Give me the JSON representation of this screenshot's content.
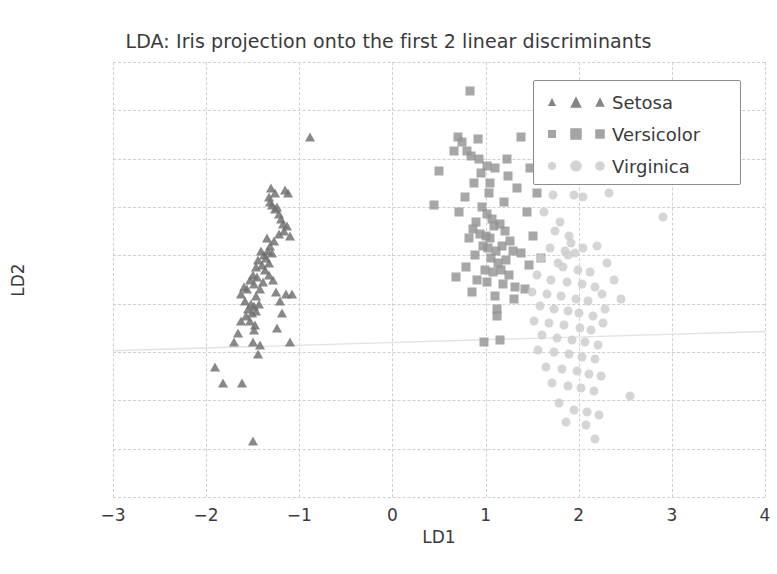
{
  "chart_data": {
    "type": "scatter",
    "title": "LDA: Iris projection onto the first 2 linear discriminants",
    "xlabel": "LD1",
    "ylabel": "LD2",
    "xlim": [
      -3,
      4
    ],
    "ylim": [
      -2.8,
      -1.0
    ],
    "xticks": [
      "-3",
      "-2",
      "-1",
      "0",
      "1",
      "2",
      "3",
      "4"
    ],
    "xtick_values": [
      -3,
      -2,
      -1,
      0,
      1,
      2,
      3,
      4
    ],
    "yticks": [
      "-1.0",
      "-1.2",
      "-1.4",
      "-1.6",
      "-1.8",
      "-2.0",
      "-2.2",
      "-2.4",
      "-2.6",
      "-2.8"
    ],
    "ytick_values": [
      -1.0,
      -1.2,
      -1.4,
      -1.6,
      -1.8,
      -2.0,
      -2.2,
      -2.4,
      -2.6,
      -2.8
    ],
    "grid": true,
    "legend_position": "upper right",
    "colors": {
      "setosa": "#6e6e6e",
      "versicolor": "#949494",
      "virginica": "#cccccc",
      "grid": "#cfcfcf",
      "text": "#3a3a3a",
      "legend_border": "#8d8d8d",
      "trendline": "#e2e2e2"
    },
    "trendline": {
      "x": [
        -3.0,
        4.0
      ],
      "y": [
        -2.195,
        -2.115
      ]
    },
    "series": [
      {
        "name": "Setosa",
        "marker": "triangle",
        "color": "#6e6e6e",
        "points": [
          [
            -1.3,
            -1.52
          ],
          [
            -1.26,
            -1.54
          ],
          [
            -1.33,
            -1.56
          ],
          [
            -1.15,
            -1.53
          ],
          [
            -1.12,
            -1.54
          ],
          [
            -1.29,
            -1.59
          ],
          [
            -1.26,
            -1.61
          ],
          [
            -1.22,
            -1.63
          ],
          [
            -1.31,
            -1.58
          ],
          [
            -1.24,
            -1.6
          ],
          [
            -1.2,
            -1.65
          ],
          [
            -1.18,
            -1.67
          ],
          [
            -1.16,
            -1.7
          ],
          [
            -1.13,
            -1.68
          ],
          [
            -1.1,
            -1.72
          ],
          [
            -1.22,
            -1.71
          ],
          [
            -1.27,
            -1.74
          ],
          [
            -1.31,
            -1.76
          ],
          [
            -1.35,
            -1.73
          ],
          [
            -1.34,
            -1.78
          ],
          [
            -1.38,
            -1.8
          ],
          [
            -1.41,
            -1.78
          ],
          [
            -1.44,
            -1.82
          ],
          [
            -1.4,
            -1.84
          ],
          [
            -1.36,
            -1.81
          ],
          [
            -1.32,
            -1.83
          ],
          [
            -1.29,
            -1.79
          ],
          [
            -1.47,
            -1.85
          ],
          [
            -1.5,
            -1.88
          ],
          [
            -1.53,
            -1.9
          ],
          [
            -1.49,
            -1.92
          ],
          [
            -1.45,
            -1.89
          ],
          [
            -1.56,
            -1.94
          ],
          [
            -1.59,
            -1.93
          ],
          [
            -1.25,
            -1.95
          ],
          [
            -1.14,
            -1.96
          ],
          [
            -1.08,
            -1.96
          ],
          [
            -1.63,
            -1.96
          ],
          [
            -1.52,
            -2.0
          ],
          [
            -1.55,
            -2.02
          ],
          [
            -1.49,
            -2.01
          ],
          [
            -1.46,
            -2.03
          ],
          [
            -1.43,
            -2.0
          ],
          [
            -1.51,
            -2.04
          ],
          [
            -1.57,
            -2.05
          ],
          [
            -1.63,
            -2.07
          ],
          [
            -1.48,
            -2.09
          ],
          [
            -1.19,
            -2.04
          ],
          [
            -1.66,
            -2.12
          ],
          [
            -1.49,
            -2.11
          ],
          [
            -1.24,
            -2.1
          ],
          [
            -1.7,
            -2.16
          ],
          [
            -1.5,
            -2.16
          ],
          [
            -1.42,
            -2.17
          ],
          [
            -1.1,
            -2.16
          ],
          [
            -1.44,
            -2.21
          ],
          [
            -1.9,
            -2.26
          ],
          [
            -1.82,
            -2.33
          ],
          [
            -1.62,
            -2.33
          ],
          [
            -1.5,
            -2.57
          ],
          [
            -0.88,
            -1.31
          ],
          [
            -1.37,
            -1.86
          ],
          [
            -1.39,
            -1.91
          ],
          [
            -1.33,
            -1.88
          ],
          [
            -1.28,
            -1.9
          ],
          [
            -1.42,
            -1.94
          ],
          [
            -1.46,
            -1.97
          ],
          [
            -1.21,
            -1.99
          ],
          [
            -1.58,
            -1.99
          ],
          [
            -1.53,
            -2.07
          ]
        ]
      },
      {
        "name": "Versicolor",
        "marker": "square",
        "color": "#949494",
        "points": [
          [
            0.83,
            -1.12
          ],
          [
            0.7,
            -1.31
          ],
          [
            0.75,
            -1.33
          ],
          [
            0.92,
            -1.32
          ],
          [
            1.38,
            -1.31
          ],
          [
            0.66,
            -1.37
          ],
          [
            0.8,
            -1.37
          ],
          [
            0.84,
            -1.39
          ],
          [
            1.23,
            -1.4
          ],
          [
            1.1,
            -1.44
          ],
          [
            1.48,
            -1.44
          ],
          [
            0.5,
            -1.45
          ],
          [
            0.95,
            -1.46
          ],
          [
            1.24,
            -1.47
          ],
          [
            0.88,
            -1.5
          ],
          [
            0.45,
            -1.59
          ],
          [
            0.78,
            -1.56
          ],
          [
            1.04,
            -1.54
          ],
          [
            1.34,
            -1.52
          ],
          [
            0.96,
            -1.6
          ],
          [
            1.2,
            -1.58
          ],
          [
            1.45,
            -1.62
          ],
          [
            0.72,
            -1.62
          ],
          [
            1.01,
            -1.63
          ],
          [
            1.07,
            -1.65
          ],
          [
            0.9,
            -1.66
          ],
          [
            1.09,
            -1.68
          ],
          [
            1.15,
            -1.67
          ],
          [
            0.86,
            -1.69
          ],
          [
            0.94,
            -1.71
          ],
          [
            1.0,
            -1.72
          ],
          [
            1.05,
            -1.73
          ],
          [
            1.21,
            -1.7
          ],
          [
            1.26,
            -1.74
          ],
          [
            0.82,
            -1.73
          ],
          [
            0.97,
            -1.76
          ],
          [
            1.03,
            -1.77
          ],
          [
            1.11,
            -1.78
          ],
          [
            1.18,
            -1.76
          ],
          [
            1.29,
            -1.78
          ],
          [
            0.89,
            -1.8
          ],
          [
            1.06,
            -1.81
          ],
          [
            1.13,
            -1.83
          ],
          [
            1.22,
            -1.82
          ],
          [
            0.79,
            -1.85
          ],
          [
            0.99,
            -1.86
          ],
          [
            1.08,
            -1.87
          ],
          [
            1.17,
            -1.86
          ],
          [
            1.25,
            -1.88
          ],
          [
            0.68,
            -1.89
          ],
          [
            0.91,
            -1.9
          ],
          [
            1.02,
            -1.91
          ],
          [
            1.19,
            -1.92
          ],
          [
            1.32,
            -1.93
          ],
          [
            0.85,
            -1.95
          ],
          [
            1.1,
            -1.97
          ],
          [
            1.3,
            -1.98
          ],
          [
            1.42,
            -1.94
          ],
          [
            1.12,
            -2.02
          ],
          [
            1.12,
            -2.05
          ],
          [
            1.15,
            -2.15
          ],
          [
            0.98,
            -2.16
          ],
          [
            1.6,
            -1.81
          ],
          [
            1.55,
            -1.54
          ],
          [
            1.51,
            -1.72
          ],
          [
            1.38,
            -1.79
          ],
          [
            1.47,
            -1.84
          ],
          [
            0.93,
            -1.4
          ],
          [
            1.02,
            -1.43
          ],
          [
            1.05,
            -1.5
          ]
        ]
      },
      {
        "name": "Virginica",
        "marker": "circle",
        "color": "#cccccc",
        "points": [
          [
            1.72,
            -1.55
          ],
          [
            1.95,
            -1.55
          ],
          [
            2.05,
            -1.56
          ],
          [
            2.32,
            -1.54
          ],
          [
            2.9,
            -1.64
          ],
          [
            1.63,
            -1.62
          ],
          [
            1.8,
            -1.66
          ],
          [
            1.75,
            -1.7
          ],
          [
            1.9,
            -1.72
          ],
          [
            1.92,
            -1.75
          ],
          [
            1.69,
            -1.77
          ],
          [
            1.85,
            -1.78
          ],
          [
            1.88,
            -1.8
          ],
          [
            1.96,
            -1.79
          ],
          [
            2.05,
            -1.77
          ],
          [
            2.2,
            -1.76
          ],
          [
            1.6,
            -1.81
          ],
          [
            1.78,
            -1.83
          ],
          [
            1.83,
            -1.85
          ],
          [
            1.99,
            -1.86
          ],
          [
            2.12,
            -1.87
          ],
          [
            2.3,
            -1.83
          ],
          [
            1.55,
            -1.88
          ],
          [
            1.7,
            -1.9
          ],
          [
            1.87,
            -1.91
          ],
          [
            2.03,
            -1.92
          ],
          [
            2.18,
            -1.93
          ],
          [
            2.38,
            -1.9
          ],
          [
            1.5,
            -1.95
          ],
          [
            1.66,
            -1.96
          ],
          [
            1.81,
            -1.97
          ],
          [
            1.97,
            -1.98
          ],
          [
            2.1,
            -1.99
          ],
          [
            2.25,
            -1.96
          ],
          [
            2.45,
            -1.98
          ],
          [
            1.58,
            -2.01
          ],
          [
            1.74,
            -2.02
          ],
          [
            1.89,
            -2.03
          ],
          [
            2.0,
            -2.04
          ],
          [
            2.15,
            -2.05
          ],
          [
            2.28,
            -2.02
          ],
          [
            1.52,
            -2.07
          ],
          [
            1.68,
            -2.08
          ],
          [
            1.84,
            -2.09
          ],
          [
            2.01,
            -2.1
          ],
          [
            2.13,
            -2.11
          ],
          [
            2.26,
            -2.08
          ],
          [
            1.61,
            -2.13
          ],
          [
            1.77,
            -2.14
          ],
          [
            1.93,
            -2.15
          ],
          [
            2.07,
            -2.16
          ],
          [
            2.21,
            -2.17
          ],
          [
            1.56,
            -2.19
          ],
          [
            1.73,
            -2.2
          ],
          [
            1.9,
            -2.21
          ],
          [
            2.04,
            -2.22
          ],
          [
            2.17,
            -2.23
          ],
          [
            1.65,
            -2.26
          ],
          [
            1.82,
            -2.27
          ],
          [
            1.98,
            -2.28
          ],
          [
            2.11,
            -2.29
          ],
          [
            2.24,
            -2.3
          ],
          [
            1.71,
            -2.33
          ],
          [
            1.88,
            -2.34
          ],
          [
            2.02,
            -2.35
          ],
          [
            2.16,
            -2.36
          ],
          [
            2.55,
            -2.38
          ],
          [
            1.79,
            -2.41
          ],
          [
            1.95,
            -2.44
          ],
          [
            2.09,
            -2.45
          ],
          [
            2.22,
            -2.46
          ],
          [
            2.18,
            -2.56
          ],
          [
            2.08,
            -2.5
          ],
          [
            1.86,
            -2.49
          ]
        ]
      }
    ]
  }
}
